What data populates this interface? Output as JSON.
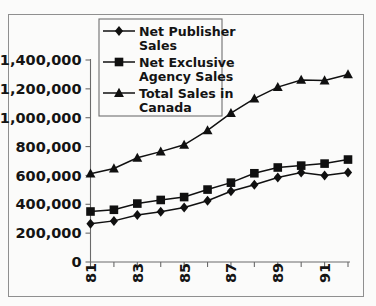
{
  "chart_data": {
    "type": "line",
    "title": "",
    "subtitle": "",
    "xlabel": "",
    "ylabel": "",
    "x": [
      81,
      82,
      83,
      84,
      85,
      86,
      87,
      88,
      89,
      90,
      91,
      92
    ],
    "x_tick_labels": [
      "81",
      "",
      "83",
      "",
      "85",
      "",
      "87",
      "",
      "89",
      "",
      "91",
      ""
    ],
    "x_tick_labels_visible": [
      "81",
      "83",
      "85",
      "87",
      "89",
      "91"
    ],
    "xlim": [
      81,
      92
    ],
    "ylim": [
      0,
      1400000
    ],
    "y_ticks": [
      0,
      200000,
      400000,
      600000,
      800000,
      1000000,
      1200000,
      1400000
    ],
    "y_tick_labels": [
      "0",
      "200,000",
      "400,000",
      "600,000",
      "800,000",
      "1,000,000",
      "1,200,000",
      "1,400,000"
    ],
    "grid": false,
    "legend_position": "upper center",
    "series": [
      {
        "name": "Net Publisher Sales",
        "marker": "diamond",
        "color": "#101010",
        "values": [
          265000,
          285000,
          325000,
          348000,
          378000,
          425000,
          490000,
          535000,
          585000,
          620000,
          600000,
          620000
        ]
      },
      {
        "name": "Net Exclusive Agency Sales",
        "marker": "square",
        "color": "#101010",
        "values": [
          350000,
          362000,
          405000,
          430000,
          450000,
          502000,
          550000,
          615000,
          655000,
          668000,
          682000,
          710000
        ]
      },
      {
        "name": "Total Sales in Canada",
        "marker": "triangle",
        "color": "#101010",
        "values": [
          612000,
          648000,
          722000,
          765000,
          812000,
          912000,
          1032000,
          1132000,
          1212000,
          1262000,
          1258000,
          1300000
        ]
      }
    ]
  },
  "legend": {
    "entries": [
      {
        "label_line1": "Net Publisher",
        "label_line2": "Sales",
        "marker": "diamond"
      },
      {
        "label_line1": "Net Exclusive",
        "label_line2": "Agency Sales",
        "marker": "square"
      },
      {
        "label_line1": "Total Sales in",
        "label_line2": "Canada",
        "marker": "triangle"
      }
    ]
  },
  "colors": {
    "ink": "#101010",
    "axis": "#6a6a6a",
    "frame": "#8f8f8f",
    "background": "#fbfbfa"
  }
}
